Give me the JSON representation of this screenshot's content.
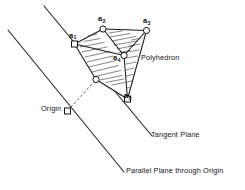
{
  "figure": {
    "background_color": "#ffffff",
    "ink_color": "#141414",
    "width": 245,
    "height": 190
  },
  "vertices": [
    {
      "id": "a1",
      "label": "a",
      "subscript": "1",
      "marker": "square",
      "x": 74.5,
      "y": 44.0
    },
    {
      "id": "a2",
      "label": "a",
      "subscript": "2",
      "marker": "circle",
      "x": 103.0,
      "y": 29.0
    },
    {
      "id": "a3",
      "label": "a",
      "subscript": "3",
      "marker": "circle",
      "x": 146.5,
      "y": 30.5
    },
    {
      "id": "a4",
      "label": "a",
      "subscript": "4",
      "marker": "circle",
      "x": 124.0,
      "y": 55.5
    },
    {
      "id": "a5",
      "label": "a",
      "subscript": "5",
      "marker": "square",
      "x": 127.5,
      "y": 99.0
    },
    {
      "id": "a6",
      "label": "",
      "subscript": "",
      "marker": "circle",
      "x": 96.0,
      "y": 79.5
    }
  ],
  "origin_point": {
    "id": "origin",
    "marker": "square",
    "x": 67.5,
    "y": 111.0
  },
  "edges": [
    {
      "from": "a1",
      "to": "a2"
    },
    {
      "from": "a2",
      "to": "a3"
    },
    {
      "from": "a3",
      "to": "a4"
    },
    {
      "from": "a4",
      "to": "a2"
    },
    {
      "from": "a1",
      "to": "a4"
    },
    {
      "from": "a3",
      "to": "a5"
    },
    {
      "from": "a4",
      "to": "a5"
    },
    {
      "from": "a5",
      "to": "a6"
    },
    {
      "from": "a6",
      "to": "a1"
    }
  ],
  "dashed_connector": {
    "from": "origin",
    "to": "a6"
  },
  "planes": [
    {
      "id": "tangent-plane",
      "label": "Tangent Plane",
      "x1": 44.0,
      "y1": 6.0,
      "x2": 152.0,
      "y2": 136.0
    },
    {
      "id": "parallel-plane",
      "label": "Parallel Plane through Origin",
      "x1": 8.0,
      "y1": 30.0,
      "x2": 124.0,
      "y2": 172.0
    }
  ],
  "labels": {
    "a1": "a",
    "a1_sub": "1",
    "a2": "a",
    "a2_sub": "2",
    "a3": "a",
    "a3_sub": "3",
    "a4": "a",
    "a4_sub": "4",
    "a5": "a",
    "a5_sub": "5",
    "polyhedron": "Polyhedron",
    "origin": "Origin",
    "tangent_plane": "Tangent Plane",
    "parallel_plane": "Parallel Plane through Origin"
  },
  "shading": {
    "style": "hand-drawn hatch lines",
    "stroke_color": "#3a3a3a",
    "faces_shaded": [
      "a1-a2-a4-a6",
      "a2-a3-a4",
      "a3-a4-a5"
    ]
  }
}
